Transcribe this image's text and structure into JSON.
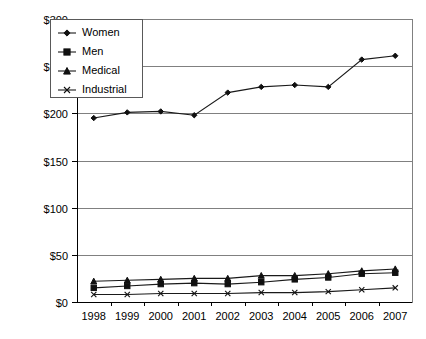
{
  "chart_data": {
    "type": "line",
    "title": "",
    "xlabel": "",
    "ylabel": "",
    "categories": [
      "1998",
      "1999",
      "2000",
      "2001",
      "2002",
      "2003",
      "2004",
      "2005",
      "2006",
      "2007"
    ],
    "ylim": [
      0,
      300
    ],
    "ytick_values": [
      0,
      50,
      100,
      150,
      200,
      250,
      300
    ],
    "ytick_labels": [
      "$0",
      "$50",
      "$100",
      "$150",
      "$200",
      "$250",
      "$300"
    ],
    "grid": true,
    "legend_position": "top-left",
    "series": [
      {
        "name": "Women",
        "marker": "diamond",
        "values": [
          195,
          201,
          202,
          198,
          222,
          228,
          230,
          228,
          257,
          261
        ]
      },
      {
        "name": "Men",
        "marker": "square",
        "values": [
          15,
          17,
          19,
          20,
          19,
          21,
          24,
          26,
          30,
          31
        ]
      },
      {
        "name": "Medical",
        "marker": "triangle",
        "values": [
          22,
          23,
          24,
          25,
          25,
          28,
          28,
          30,
          33,
          35
        ]
      },
      {
        "name": "Industrial",
        "marker": "x",
        "values": [
          8,
          8,
          9,
          9,
          9,
          10,
          10,
          11,
          13,
          15
        ]
      }
    ]
  },
  "legend": {
    "items": [
      {
        "label": "Women"
      },
      {
        "label": "Men"
      },
      {
        "label": "Medical"
      },
      {
        "label": "Industrial"
      }
    ]
  },
  "colors": {
    "series": "#101010",
    "grid": "#808080",
    "axis": "#000000",
    "background": "#ffffff"
  }
}
